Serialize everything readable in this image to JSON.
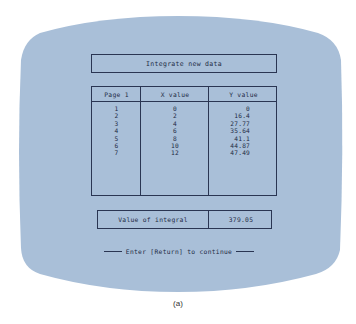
{
  "colors": {
    "background": "#ffffff",
    "screen": "#a9bfd8",
    "text": "#1e2a44",
    "border": "#2a3552"
  },
  "title": "Integrate new data",
  "table": {
    "headers": [
      "Page 1",
      "X value",
      "Y value"
    ],
    "rows": [
      {
        "index": "1",
        "x": "0",
        "y": "0"
      },
      {
        "index": "2",
        "x": "2",
        "y": "16.4"
      },
      {
        "index": "3",
        "x": "4",
        "y": "27.77"
      },
      {
        "index": "4",
        "x": "6",
        "y": "35.64"
      },
      {
        "index": "5",
        "x": "8",
        "y": "41.1"
      },
      {
        "index": "6",
        "x": "10",
        "y": "44.87"
      },
      {
        "index": "7",
        "x": "12",
        "y": "47.49"
      }
    ]
  },
  "integral": {
    "label": "Value of integral",
    "value": "379.05"
  },
  "prompt": "Enter [Return] to continue",
  "caption": "(a)"
}
